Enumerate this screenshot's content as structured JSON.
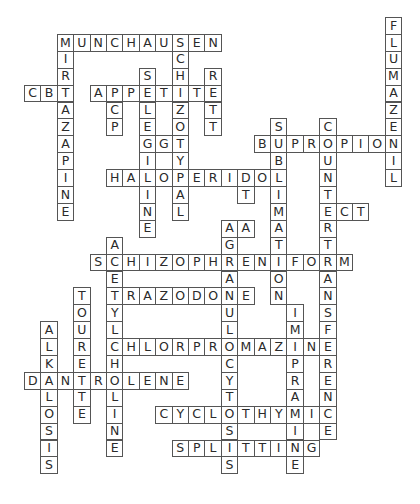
{
  "puzzle": {
    "type": "crossword",
    "grid": {
      "origin_x": 24,
      "origin_y": 17,
      "cell_w": 16.4,
      "cell_h": 16.9
    },
    "colors": {
      "border": "#555555",
      "letter": "#2a2a2a",
      "background": "#ffffff"
    },
    "across": [
      {
        "word": "MUNCHAUSEN",
        "col": 2,
        "row": 1
      },
      {
        "word": "CBT",
        "col": 0,
        "row": 4
      },
      {
        "word": "APPETITE",
        "col": 4,
        "row": 4
      },
      {
        "word": "GGT",
        "col": 7,
        "row": 7
      },
      {
        "word": "BUPROPION",
        "col": 14,
        "row": 7
      },
      {
        "word": "HALOPERIDOL",
        "col": 5,
        "row": 9
      },
      {
        "word": "ECT",
        "col": 18,
        "row": 11
      },
      {
        "word": "AA",
        "col": 12,
        "row": 12
      },
      {
        "word": "SCHIZOPHRENIFORM",
        "col": 4,
        "row": 14
      },
      {
        "word": "TRAZODONE",
        "col": 5,
        "row": 16
      },
      {
        "word": "CHLORPROMAZINE",
        "col": 5,
        "row": 19
      },
      {
        "word": "DANTROLENE",
        "col": 0,
        "row": 21
      },
      {
        "word": "CYCLOTHYMIC",
        "col": 8,
        "row": 23
      },
      {
        "word": "SPLITTING",
        "col": 9,
        "row": 25
      }
    ],
    "down": [
      {
        "word": "FLUMAZENIL",
        "col": 22,
        "row": 0
      },
      {
        "word": "MIRTAZAPINE",
        "col": 2,
        "row": 1
      },
      {
        "word": "SCHIZOTYPAL",
        "col": 9,
        "row": 1
      },
      {
        "word": "SELEGILINE",
        "col": 7,
        "row": 3
      },
      {
        "word": "RETT",
        "col": 11,
        "row": 3
      },
      {
        "word": "PCP",
        "col": 5,
        "row": 4
      },
      {
        "word": "SUBLIMATION",
        "col": 15,
        "row": 6
      },
      {
        "word": "COUNTERTRANSFERENCE",
        "col": 18,
        "row": 6
      },
      {
        "word": "DT",
        "col": 13,
        "row": 9
      },
      {
        "word": "AGRANULOCYTOSIS",
        "col": 12,
        "row": 12
      },
      {
        "word": "ACETYLCHOLINE",
        "col": 5,
        "row": 13
      },
      {
        "word": "TOURETTE",
        "col": 3,
        "row": 16
      },
      {
        "word": "ALKALOSIS",
        "col": 1,
        "row": 18
      },
      {
        "word": "IMIPRAMINE",
        "col": 16,
        "row": 17
      }
    ]
  }
}
